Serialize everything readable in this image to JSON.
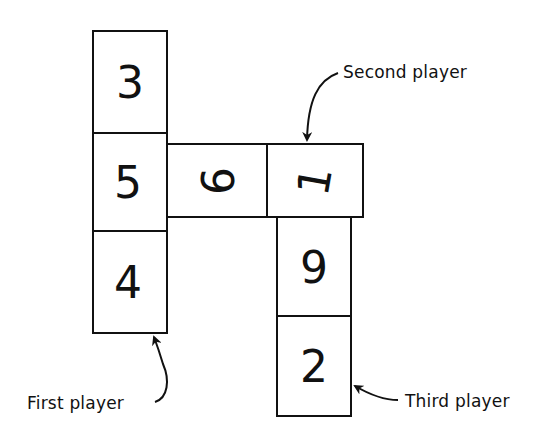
{
  "diagram": {
    "stroke_color": "#111111",
    "background": "#ffffff",
    "tiles": [
      {
        "id": "t1",
        "value": "3",
        "x": 93,
        "y": 31,
        "w": 74,
        "h": 102
      },
      {
        "id": "t2",
        "value": "5",
        "x": 93,
        "y": 133,
        "w": 74,
        "h": 98
      },
      {
        "id": "t3",
        "value": "4",
        "x": 93,
        "y": 231,
        "w": 74,
        "h": 102
      },
      {
        "id": "t4",
        "value": "6",
        "x": 167,
        "y": 144,
        "w": 100,
        "h": 73,
        "rotated": true
      },
      {
        "id": "t5",
        "value": "1",
        "x": 267,
        "y": 144,
        "w": 96,
        "h": 73,
        "rotated": true
      },
      {
        "id": "t6",
        "value": "9",
        "x": 277,
        "y": 217,
        "w": 74,
        "h": 99
      },
      {
        "id": "t7",
        "value": "2",
        "x": 277,
        "y": 316,
        "w": 74,
        "h": 100
      }
    ],
    "labels": {
      "first_player": "First player",
      "second_player": "Second player",
      "third_player": "Third player"
    }
  }
}
